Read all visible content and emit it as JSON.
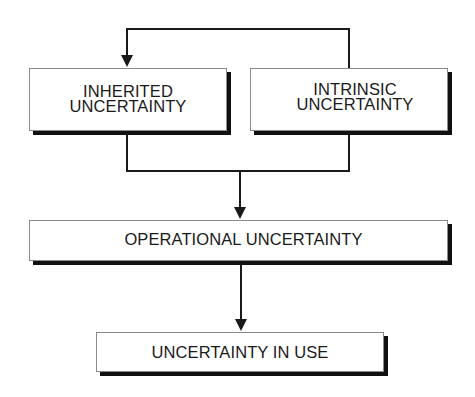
{
  "diagram": {
    "type": "flowchart",
    "nodes": [
      {
        "id": "inherited",
        "lines": [
          "INHERITED",
          "UNCERTAINTY"
        ]
      },
      {
        "id": "intrinsic",
        "lines": [
          "INTRINSIC",
          "UNCERTAINTY"
        ]
      },
      {
        "id": "operational",
        "label": "OPERATIONAL UNCERTAINTY"
      },
      {
        "id": "in_use",
        "label": "UNCERTAINTY IN USE"
      }
    ],
    "edges": [
      {
        "from": "intrinsic",
        "to": "inherited",
        "style": "feedback loop over top"
      },
      {
        "from": "inherited",
        "to": "operational",
        "style": "merged"
      },
      {
        "from": "intrinsic",
        "to": "operational",
        "style": "merged"
      },
      {
        "from": "operational",
        "to": "in_use"
      }
    ],
    "colors": {
      "line": "#1a1a1a",
      "box_border": "#8a8a8a",
      "box_shadow": "#111111",
      "text": "#1a1a1a",
      "background": "#ffffff"
    }
  }
}
